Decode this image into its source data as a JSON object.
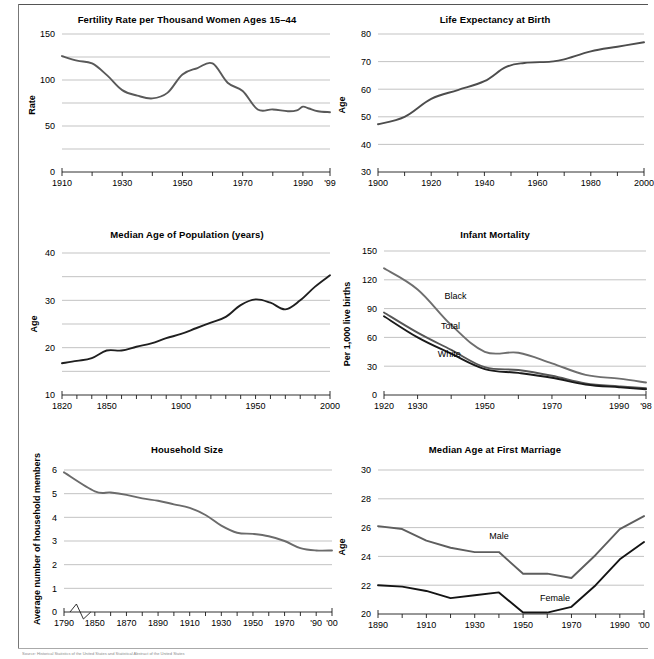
{
  "footer": {
    "source_note": "Source:   Historical Statistics of the United States and Statistical Abstract of the United States"
  },
  "chart_data": [
    {
      "id": "fertility-rate",
      "type": "line",
      "title": "Fertility Rate per Thousand Women Ages 15–44",
      "xlabel": "",
      "ylabel": "Rate",
      "xlim": [
        1910,
        1999
      ],
      "ylim": [
        0,
        150
      ],
      "yticks": [
        0,
        50,
        100,
        150
      ],
      "ytick_labels": [
        "0",
        "50",
        "100",
        "150"
      ],
      "gridlines": [
        25,
        50,
        75,
        100,
        125,
        150
      ],
      "xticks": [
        1910,
        1920,
        1930,
        1940,
        1950,
        1960,
        1970,
        1980,
        1990,
        1999
      ],
      "xtick_labels": [
        "1910",
        "",
        "1930",
        "",
        "1950",
        "",
        "1970",
        "",
        "1990",
        "'99"
      ],
      "grid": true,
      "legend_position": "none",
      "series": [
        {
          "name": "Fertility rate",
          "color": "#595959",
          "x": [
            1910,
            1915,
            1920,
            1925,
            1930,
            1935,
            1940,
            1945,
            1950,
            1955,
            1960,
            1965,
            1970,
            1975,
            1980,
            1985,
            1988,
            1990,
            1992,
            1995,
            1999
          ],
          "values": [
            126,
            121,
            118,
            105,
            89,
            83,
            80,
            86,
            106,
            113,
            118,
            97,
            88,
            68,
            68,
            66,
            67,
            71,
            69,
            66,
            65
          ]
        }
      ]
    },
    {
      "id": "life-expectancy",
      "type": "line",
      "title": "Life Expectancy at Birth",
      "xlabel": "",
      "ylabel": "Age",
      "xlim": [
        1900,
        2000
      ],
      "ylim": [
        30,
        80
      ],
      "yticks": [
        30,
        40,
        50,
        60,
        70,
        80
      ],
      "ytick_labels": [
        "30",
        "40",
        "50",
        "60",
        "70",
        "80"
      ],
      "gridlines": [
        40,
        50,
        60,
        70,
        80
      ],
      "xticks": [
        1900,
        1910,
        1920,
        1930,
        1940,
        1950,
        1960,
        1970,
        1980,
        1990,
        2000
      ],
      "xtick_labels": [
        "1900",
        "",
        "1920",
        "",
        "1940",
        "",
        "1960",
        "",
        "1980",
        "",
        "2000"
      ],
      "grid": true,
      "legend_position": "none",
      "series": [
        {
          "name": "Life expectancy",
          "color": "#4d4d4d",
          "x": [
            1900,
            1910,
            1920,
            1930,
            1940,
            1948,
            1955,
            1965,
            1970,
            1980,
            1990,
            2000
          ],
          "values": [
            47.3,
            50.0,
            56.5,
            59.7,
            62.9,
            68.0,
            69.5,
            70.0,
            70.8,
            73.7,
            75.4,
            77.0
          ]
        }
      ]
    },
    {
      "id": "median-age-population",
      "type": "line",
      "title": "Median Age of Population (years)",
      "xlabel": "",
      "ylabel": "Age",
      "xlim": [
        1820,
        2000
      ],
      "ylim": [
        10,
        40
      ],
      "yticks": [
        10,
        20,
        30,
        40
      ],
      "ytick_labels": [
        "10",
        "20",
        "30",
        "40"
      ],
      "gridlines": [
        15,
        20,
        25,
        30,
        35,
        40
      ],
      "xticks": [
        1820,
        1830,
        1840,
        1850,
        1860,
        1870,
        1880,
        1890,
        1900,
        1910,
        1920,
        1930,
        1940,
        1950,
        1960,
        1970,
        1980,
        1990,
        2000
      ],
      "xtick_labels": [
        "1820",
        "",
        "",
        "1850",
        "",
        "",
        "",
        "",
        "1900",
        "",
        "",
        "",
        "",
        "1950",
        "",
        "",
        "",
        "",
        "2000"
      ],
      "grid": true,
      "legend_position": "none",
      "series": [
        {
          "name": "Median age",
          "color": "#1f1f1f",
          "x": [
            1820,
            1830,
            1840,
            1850,
            1860,
            1870,
            1880,
            1890,
            1900,
            1910,
            1920,
            1930,
            1940,
            1950,
            1960,
            1970,
            1980,
            1990,
            2000
          ],
          "values": [
            16.7,
            17.2,
            17.8,
            19.4,
            19.4,
            20.2,
            20.9,
            22.0,
            22.9,
            24.1,
            25.3,
            26.5,
            29.0,
            30.2,
            29.5,
            28.1,
            30.0,
            32.9,
            35.3
          ]
        }
      ]
    },
    {
      "id": "infant-mortality",
      "type": "line",
      "title": "Infant Mortality",
      "xlabel": "",
      "ylabel": "Per 1,000 live births",
      "xlim": [
        1920,
        1998
      ],
      "ylim": [
        0,
        150
      ],
      "yticks": [
        0,
        30,
        60,
        90,
        120,
        150
      ],
      "ytick_labels": [
        "0",
        "30",
        "60",
        "90",
        "120",
        "150"
      ],
      "gridlines": [
        30,
        60,
        90,
        120,
        150
      ],
      "xticks": [
        1920,
        1930,
        1940,
        1950,
        1960,
        1970,
        1980,
        1990,
        1998
      ],
      "xtick_labels": [
        "1920",
        "1930",
        "",
        "1950",
        "",
        "1970",
        "",
        "1990",
        "'98"
      ],
      "grid": true,
      "legend_position": "inline",
      "series": [
        {
          "name": "Black",
          "label": "Black",
          "color": "#6e6e6e",
          "x": [
            1920,
            1930,
            1940,
            1950,
            1960,
            1970,
            1980,
            1990,
            1998
          ],
          "values": [
            132,
            110,
            73,
            45,
            44,
            33,
            21,
            17,
            13
          ]
        },
        {
          "name": "Total",
          "label": "Total",
          "color": "#565656",
          "x": [
            1920,
            1930,
            1940,
            1950,
            1960,
            1970,
            1980,
            1990,
            1998
          ],
          "values": [
            86,
            65,
            47,
            29,
            26,
            20,
            12,
            9,
            7
          ]
        },
        {
          "name": "White",
          "label": "White",
          "color": "#1a1a1a",
          "x": [
            1920,
            1930,
            1940,
            1950,
            1960,
            1970,
            1980,
            1990,
            1998
          ],
          "values": [
            82,
            60,
            43,
            27,
            23,
            18,
            11,
            8,
            6
          ]
        }
      ]
    },
    {
      "id": "household-size",
      "type": "line",
      "title": "Household Size",
      "xlabel": "",
      "ylabel": "Average number of household members",
      "xlim": [
        1790,
        2000
      ],
      "ylim": [
        0,
        6
      ],
      "yticks": [
        0,
        1,
        2,
        3,
        4,
        5,
        6
      ],
      "ytick_labels": [
        "0",
        "1",
        "2",
        "3",
        "4",
        "5",
        "6"
      ],
      "gridlines": [
        1,
        2,
        3,
        4,
        5,
        6
      ],
      "axis_break": true,
      "xticks": [
        1790,
        1850,
        1860,
        1870,
        1880,
        1890,
        1900,
        1910,
        1920,
        1930,
        1940,
        1950,
        1960,
        1970,
        1980,
        1990,
        2000
      ],
      "xtick_labels": [
        "1790",
        "1850",
        "",
        "1870",
        "",
        "1890",
        "",
        "1910",
        "",
        "1930",
        "",
        "1950",
        "",
        "1970",
        "",
        "'90",
        "'00"
      ],
      "grid": true,
      "legend_position": "none",
      "series": [
        {
          "name": "Household size",
          "color": "#6b6b6b",
          "x": [
            1790,
            1850,
            1860,
            1870,
            1880,
            1890,
            1900,
            1910,
            1920,
            1930,
            1940,
            1950,
            1960,
            1970,
            1980,
            1990,
            2000
          ],
          "values": [
            5.9,
            5.1,
            5.05,
            4.95,
            4.8,
            4.7,
            4.55,
            4.4,
            4.1,
            3.65,
            3.35,
            3.3,
            3.2,
            3.0,
            2.7,
            2.6,
            2.6
          ]
        }
      ]
    },
    {
      "id": "median-age-first-marriage",
      "type": "line",
      "title": "Median Age at First Marriage",
      "xlabel": "",
      "ylabel": "Age",
      "xlim": [
        1890,
        2000
      ],
      "ylim": [
        20,
        30
      ],
      "yticks": [
        20,
        22,
        24,
        26,
        28,
        30
      ],
      "ytick_labels": [
        "20",
        "22",
        "24",
        "26",
        "28",
        "30"
      ],
      "gridlines": [
        22,
        24,
        26,
        28,
        30
      ],
      "xticks": [
        1890,
        1900,
        1910,
        1920,
        1930,
        1940,
        1950,
        1960,
        1970,
        1980,
        1990,
        2000
      ],
      "xtick_labels": [
        "1890",
        "",
        "1910",
        "",
        "1930",
        "",
        "1950",
        "",
        "1970",
        "",
        "1990",
        "'00"
      ],
      "grid": true,
      "legend_position": "inline",
      "series": [
        {
          "name": "Male",
          "label": "Male",
          "color": "#5e5e5e",
          "x": [
            1890,
            1900,
            1910,
            1920,
            1930,
            1940,
            1950,
            1960,
            1970,
            1980,
            1990,
            2000
          ],
          "values": [
            26.1,
            25.9,
            25.1,
            24.6,
            24.3,
            24.3,
            22.8,
            22.8,
            22.5,
            24.1,
            25.9,
            26.8
          ]
        },
        {
          "name": "Female",
          "label": "Female",
          "color": "#141414",
          "x": [
            1890,
            1900,
            1910,
            1920,
            1930,
            1940,
            1950,
            1960,
            1970,
            1980,
            1990,
            2000
          ],
          "values": [
            22.0,
            21.9,
            21.6,
            21.1,
            21.3,
            21.5,
            20.1,
            20.1,
            20.5,
            22.0,
            23.8,
            25.0
          ]
        }
      ]
    }
  ]
}
